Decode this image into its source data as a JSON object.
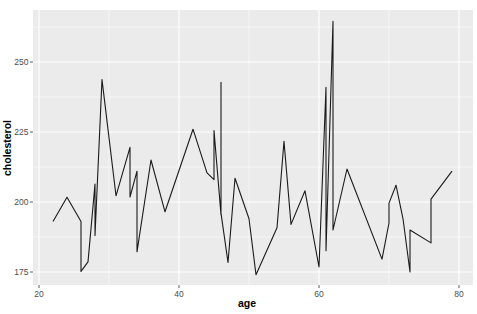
{
  "chart_data": {
    "type": "line",
    "title": "",
    "xlabel": "age",
    "ylabel": "cholesterol",
    "xlim": [
      19,
      82
    ],
    "ylim": [
      171,
      269
    ],
    "x_ticks": [
      20,
      40,
      60,
      80
    ],
    "y_ticks": [
      175,
      200,
      225,
      250
    ],
    "x_tick_labels": [
      "20",
      "40",
      "60",
      "80"
    ],
    "y_tick_labels": [
      "175",
      "200",
      "225",
      "250"
    ],
    "grid": true,
    "legend": null,
    "series": [
      {
        "name": "cholesterol",
        "color": "#000000",
        "points": [
          [
            22,
            193
          ],
          [
            24,
            201.7
          ],
          [
            26,
            193
          ],
          [
            26,
            175.2
          ],
          [
            27,
            178.6
          ],
          [
            28,
            206.4
          ],
          [
            28,
            188
          ],
          [
            29,
            243.7
          ],
          [
            31,
            202.2
          ],
          [
            33,
            219.5
          ],
          [
            33,
            201.8
          ],
          [
            34,
            211
          ],
          [
            34,
            182.2
          ],
          [
            36,
            215
          ],
          [
            38,
            196.5
          ],
          [
            42,
            226
          ],
          [
            44,
            210.4
          ],
          [
            45,
            208
          ],
          [
            45,
            225.5
          ],
          [
            46,
            195.5
          ],
          [
            46,
            242.7
          ],
          [
            46,
            196
          ],
          [
            47,
            178.4
          ],
          [
            48,
            208.5
          ],
          [
            50,
            194
          ],
          [
            51,
            174
          ],
          [
            54,
            190.8
          ],
          [
            55,
            221.7
          ],
          [
            56,
            192
          ],
          [
            58,
            204
          ],
          [
            60,
            176.8
          ],
          [
            61,
            241
          ],
          [
            61,
            182.6
          ],
          [
            62,
            264.5
          ],
          [
            62,
            190
          ],
          [
            64,
            211.8
          ],
          [
            69,
            179.6
          ],
          [
            70,
            192.5
          ],
          [
            70,
            199.6
          ],
          [
            71,
            206
          ],
          [
            72,
            194
          ],
          [
            73,
            175
          ],
          [
            73,
            190
          ],
          [
            76,
            185.4
          ],
          [
            76,
            201
          ],
          [
            79,
            211
          ]
        ]
      }
    ]
  },
  "style": {
    "panel_background": "#ebebeb",
    "grid_color": "#ffffff",
    "line_color": "#1a1a1a",
    "tick_color": "#333333"
  }
}
